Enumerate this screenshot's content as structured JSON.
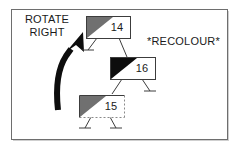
{
  "figure": {
    "annotations": {
      "rotate_label": "ROTATE\nRIGHT",
      "recolour_label": "*RECOLOUR*"
    },
    "colors": {
      "border": "#6e6e6e",
      "node_stroke": "#3c3c3c",
      "gray_fill": "#707070",
      "black_fill": "#0d0d0d",
      "text": "#1a1a1a",
      "dashed_stroke": "#8a8a8a",
      "background": "#ffffff"
    },
    "arrow": {
      "name": "rotate-right-arrow",
      "direction": "up-right",
      "style": "thick-curved-filled"
    },
    "nodes": [
      {
        "id": "node-14",
        "value": "14",
        "corner_fill": "gray",
        "border_style": "solid",
        "children": [
          "null",
          "node-16"
        ]
      },
      {
        "id": "node-16",
        "value": "16",
        "corner_fill": "black",
        "border_style": "solid",
        "children": [
          "node-15",
          "null"
        ]
      },
      {
        "id": "node-15",
        "value": "15",
        "corner_fill": "gray",
        "border_style": "dashed",
        "children": [
          "null",
          "null"
        ]
      }
    ]
  }
}
